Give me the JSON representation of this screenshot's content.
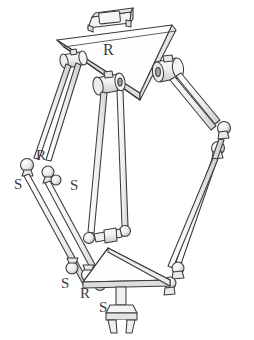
{
  "figure": {
    "background_color": "#ffffff",
    "line_color": "#3b3b3b",
    "fill_color": "#fdfdfd",
    "shade_color": "#cfcfcf"
  },
  "labels": [
    {
      "id": "base-revolute",
      "text": "R",
      "x": 103,
      "y": 55,
      "size": "main"
    },
    {
      "id": "left-upper-revolute",
      "text": "R",
      "x": 36,
      "y": 160,
      "size": "normal"
    },
    {
      "id": "left-outer-spherical",
      "text": "S",
      "x": 14,
      "y": 189,
      "size": "normal"
    },
    {
      "id": "left-inner-spherical",
      "text": "S",
      "x": 70,
      "y": 190,
      "size": "normal"
    },
    {
      "id": "platform-left-spherical",
      "text": "S",
      "x": 61,
      "y": 288,
      "size": "normal"
    },
    {
      "id": "platform-revolute",
      "text": "R",
      "x": 80,
      "y": 298,
      "size": "normal"
    },
    {
      "id": "platform-lower-spherical",
      "text": "S",
      "x": 99,
      "y": 312,
      "size": "normal"
    }
  ],
  "components": {
    "base_platform": "fixed triangular base plate",
    "base_mount": "rectangular mounting block",
    "actuators": "three cylindrical revolute actuators",
    "limbs": "three parallelogram rod linkages",
    "spherical_joints": "ball and socket joints",
    "moving_platform": "triangular end-effector platform",
    "end_effector": "two-prong gripper"
  }
}
